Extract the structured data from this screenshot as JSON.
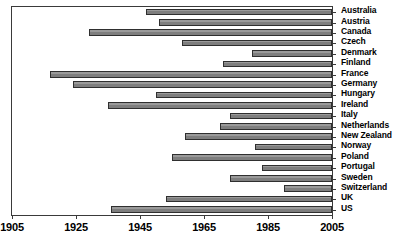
{
  "chart_data": {
    "type": "bar",
    "orientation": "horizontal",
    "subtype": "range-bar",
    "title": "",
    "xlabel": "",
    "ylabel": "",
    "xlim": [
      1905,
      2005
    ],
    "xticks": [
      1905,
      1925,
      1945,
      1965,
      1985,
      2005
    ],
    "xtick_labels": [
      "1905",
      "1925",
      "1945",
      "1965",
      "1985",
      "2005"
    ],
    "grid": false,
    "legend": null,
    "bar_color": "#8a8a8a",
    "bar_edge_color": "#2f2f2f",
    "axis_color": "#3a3a3a",
    "background": "#ffffff",
    "categories": [
      "Australia",
      "Austria",
      "Canada",
      "Czech",
      "Denmark",
      "Finland",
      "France",
      "Germany",
      "Hungary",
      "Ireland",
      "Italy",
      "Netherlands",
      "New Zealand",
      "Norway",
      "Poland",
      "Portugal",
      "Sweden",
      "Switzerland",
      "UK",
      "US"
    ],
    "series": [
      {
        "name": "Coverage period",
        "ranges": [
          {
            "category": "Australia",
            "start": 1947,
            "end": 2005
          },
          {
            "category": "Austria",
            "start": 1951,
            "end": 2005
          },
          {
            "category": "Canada",
            "start": 1929,
            "end": 2005
          },
          {
            "category": "Czech",
            "start": 1958,
            "end": 2005
          },
          {
            "category": "Denmark",
            "start": 1980,
            "end": 2005
          },
          {
            "category": "Finland",
            "start": 1971,
            "end": 2005
          },
          {
            "category": "France",
            "start": 1917,
            "end": 2005
          },
          {
            "category": "Germany",
            "start": 1924,
            "end": 2005
          },
          {
            "category": "Hungary",
            "start": 1950,
            "end": 2005
          },
          {
            "category": "Ireland",
            "start": 1935,
            "end": 2005
          },
          {
            "category": "Italy",
            "start": 1973,
            "end": 2005
          },
          {
            "category": "Netherlands",
            "start": 1970,
            "end": 2005
          },
          {
            "category": "New Zealand",
            "start": 1959,
            "end": 2005
          },
          {
            "category": "Norway",
            "start": 1981,
            "end": 2005
          },
          {
            "category": "Poland",
            "start": 1955,
            "end": 2005
          },
          {
            "category": "Portugal",
            "start": 1983,
            "end": 2005
          },
          {
            "category": "Sweden",
            "start": 1973,
            "end": 2005
          },
          {
            "category": "Switzerland",
            "start": 1990,
            "end": 2005
          },
          {
            "category": "UK",
            "start": 1953,
            "end": 2005
          },
          {
            "category": "US",
            "start": 1936,
            "end": 2005
          }
        ]
      }
    ]
  }
}
